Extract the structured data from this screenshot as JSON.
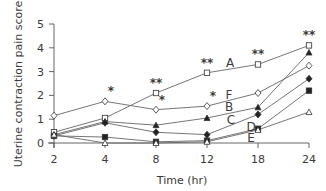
{
  "chart_data": {
    "type": "line",
    "title": "",
    "xlabel": "Time (hr)",
    "ylabel": "Uterine contraction pain score",
    "categories": [
      "2",
      "4",
      "8",
      "12",
      "18",
      "24"
    ],
    "ylim": [
      0,
      5
    ],
    "yticks": [
      "0",
      "1",
      "2",
      "3",
      "4",
      "5"
    ],
    "grid": false,
    "legend": "inline letter labels",
    "series": [
      {
        "name": "A",
        "marker": "open-square",
        "values": [
          0.45,
          1.05,
          2.1,
          2.95,
          3.3,
          4.1
        ]
      },
      {
        "name": "B",
        "marker": "filled-triangle",
        "values": [
          0.35,
          0.9,
          0.75,
          1.05,
          1.5,
          3.8
        ]
      },
      {
        "name": "C",
        "marker": "filled-diamond",
        "values": [
          0.3,
          0.85,
          0.45,
          0.35,
          1.2,
          2.7
        ]
      },
      {
        "name": "D",
        "marker": "filled-square",
        "values": [
          0.3,
          0.25,
          0.05,
          0.1,
          0.6,
          2.2
        ]
      },
      {
        "name": "E",
        "marker": "open-triangle",
        "values": [
          0.35,
          0.0,
          0.0,
          0.05,
          0.55,
          1.3
        ]
      },
      {
        "name": "F",
        "marker": "open-diamond",
        "values": [
          1.15,
          1.75,
          1.4,
          1.55,
          2.1,
          3.25
        ]
      }
    ],
    "annotations": [
      {
        "text": "*",
        "series": "F",
        "x": "4"
      },
      {
        "text": "*",
        "series": "F",
        "x": "8"
      },
      {
        "text": "*",
        "series": "F",
        "x": "12"
      },
      {
        "text": "**",
        "series": "A",
        "x": "8"
      },
      {
        "text": "**",
        "series": "A",
        "x": "12"
      },
      {
        "text": "**",
        "series": "A",
        "x": "18"
      },
      {
        "text": "**",
        "series": "A",
        "x": "24"
      }
    ],
    "series_labels": [
      {
        "text": "A",
        "x": 230,
        "y": 67
      },
      {
        "text": "F",
        "x": 229,
        "y": 99
      },
      {
        "text": "B",
        "x": 229,
        "y": 111
      },
      {
        "text": "C",
        "x": 231,
        "y": 124
      },
      {
        "text": "D",
        "x": 251,
        "y": 131
      },
      {
        "text": "E",
        "x": 251,
        "y": 142
      }
    ]
  }
}
